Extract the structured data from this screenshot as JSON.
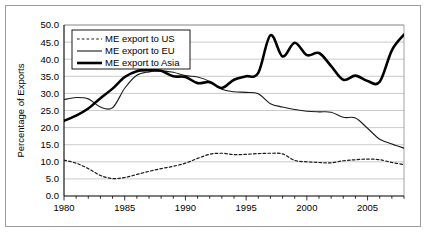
{
  "chart_data": {
    "type": "line",
    "title": "",
    "xlabel": "",
    "ylabel": "Percentage of Exports",
    "xlim": [
      1980,
      2008
    ],
    "ylim": [
      0,
      50
    ],
    "grid": true,
    "legend_position": "top-left",
    "x": [
      1980,
      1981,
      1982,
      1983,
      1984,
      1985,
      1986,
      1987,
      1988,
      1989,
      1990,
      1991,
      1992,
      1993,
      1994,
      1995,
      1996,
      1997,
      1998,
      1999,
      2000,
      2001,
      2002,
      2003,
      2004,
      2005,
      2006,
      2007,
      2008
    ],
    "y_ticks": [
      "0.0",
      "5.0",
      "10.0",
      "15.0",
      "20.0",
      "25.0",
      "30.0",
      "35.0",
      "40.0",
      "45.0",
      "50.0"
    ],
    "x_ticks_labeled": [
      "1980",
      "1985",
      "1990",
      "1995",
      "2000",
      "2005"
    ],
    "series": [
      {
        "name": "ME export to US",
        "style": "dotted",
        "color": "#1a1a1a",
        "width": 1.2,
        "values": [
          10.5,
          9.6,
          8.0,
          6.0,
          5.1,
          5.4,
          6.3,
          7.2,
          8.0,
          8.7,
          9.6,
          11.0,
          12.2,
          12.5,
          12.1,
          12.2,
          12.4,
          12.5,
          12.3,
          10.4,
          10.0,
          9.8,
          9.7,
          10.3,
          10.6,
          10.8,
          10.6,
          9.8,
          9.2
        ]
      },
      {
        "name": "ME export to EU",
        "style": "solid",
        "color": "#1a1a1a",
        "width": 1.1,
        "values": [
          28.2,
          28.8,
          28.4,
          26.0,
          25.8,
          31.5,
          35.3,
          36.3,
          36.6,
          36.2,
          35.2,
          34.8,
          33.5,
          31.2,
          30.5,
          30.3,
          29.9,
          27.0,
          26.0,
          25.3,
          24.8,
          24.6,
          24.5,
          23.0,
          22.8,
          19.8,
          16.6,
          15.2,
          14.0
        ]
      },
      {
        "name": "ME export to Asia",
        "style": "solid-thick",
        "color": "#000000",
        "width": 2.6,
        "values": [
          22.0,
          23.5,
          25.6,
          28.6,
          31.4,
          34.8,
          36.5,
          36.8,
          36.6,
          35.0,
          34.8,
          33.0,
          33.3,
          31.6,
          34.0,
          35.0,
          36.0,
          47.0,
          40.8,
          44.8,
          41.2,
          41.8,
          38.0,
          34.0,
          35.2,
          33.6,
          33.4,
          42.6,
          47.2
        ]
      }
    ]
  },
  "legend": {
    "entries": [
      {
        "label": "ME export to US",
        "swatch": "dotted-line-swatch"
      },
      {
        "label": "ME export to EU",
        "swatch": "thin-line-swatch"
      },
      {
        "label": "ME export to Asia",
        "swatch": "thick-line-swatch"
      }
    ]
  }
}
